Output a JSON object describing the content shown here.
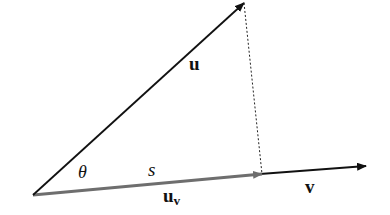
{
  "diagram": {
    "type": "vector-projection",
    "labels": {
      "u": "u",
      "v": "v",
      "theta": "θ",
      "s": "s",
      "uv_base": "u",
      "uv_sub": "v"
    },
    "colors": {
      "u_vector": "#111111",
      "v_vector": "#111111",
      "projection_vector": "#6e6e6e",
      "dotted_line": "#222222"
    }
  }
}
